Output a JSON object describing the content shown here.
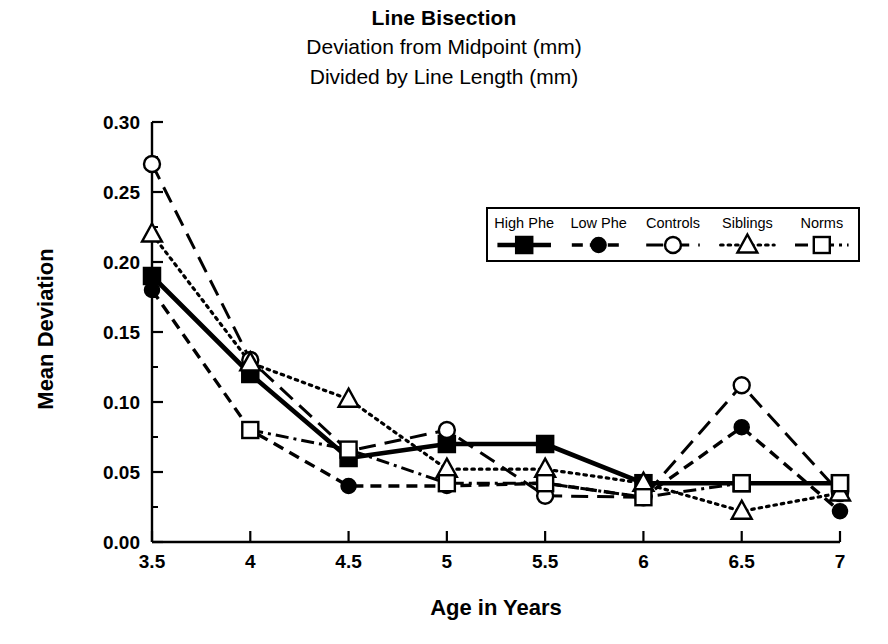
{
  "chart_data": {
    "type": "line",
    "title": "Line Bisection",
    "subtitle_1": "Deviation from Midpoint (mm)",
    "subtitle_2": "Divided by Line Length (mm)",
    "xlabel": "Age in Years",
    "ylabel": "Mean Deviation",
    "x": [
      3.5,
      4,
      4.5,
      5,
      5.5,
      6,
      6.5,
      7
    ],
    "xtick_labels": [
      "3.5",
      "4",
      "4.5",
      "5",
      "5.5",
      "6",
      "6.5",
      "7"
    ],
    "ytick_labels": [
      "0.00",
      "0.05",
      "0.10",
      "0.15",
      "0.20",
      "0.25",
      "0.30"
    ],
    "ytick_values": [
      0.0,
      0.05,
      0.1,
      0.15,
      0.2,
      0.25,
      0.3
    ],
    "yminor_values": [
      0.025,
      0.075,
      0.125,
      0.175,
      0.225,
      0.275
    ],
    "xlim": [
      3.5,
      7
    ],
    "ylim": [
      0.0,
      0.3
    ],
    "grid": false,
    "legend_position": "upper right inside",
    "series": [
      {
        "name": "High Phe",
        "marker": "filled-square",
        "line": "solid",
        "x": [
          3.5,
          4,
          4.5,
          5,
          5.5,
          6,
          6.5,
          7
        ],
        "values": [
          0.19,
          0.12,
          0.06,
          0.07,
          0.07,
          0.042,
          0.042,
          0.042
        ]
      },
      {
        "name": "Low Phe",
        "marker": "filled-circle",
        "line": "dashed",
        "x": [
          3.5,
          4,
          4.5,
          5,
          5.5,
          6,
          6.5,
          7
        ],
        "values": [
          0.18,
          0.08,
          0.04,
          0.04,
          0.042,
          0.032,
          0.082,
          0.022
        ]
      },
      {
        "name": "Controls",
        "marker": "open-circle",
        "line": "long-dash",
        "x": [
          3.5,
          4,
          4.5,
          5,
          5.5,
          6,
          6.5,
          7
        ],
        "values": [
          0.27,
          0.13,
          0.065,
          0.08,
          0.033,
          0.032,
          0.112,
          0.035
        ]
      },
      {
        "name": "Siblings",
        "marker": "open-triangle",
        "line": "dotted",
        "x": [
          3.5,
          4,
          4.5,
          5,
          5.5,
          6,
          6.5,
          7
        ],
        "values": [
          0.22,
          0.128,
          0.102,
          0.052,
          0.052,
          0.042,
          0.022,
          0.035
        ]
      },
      {
        "name": "Norms",
        "marker": "open-square",
        "line": "dash-dot",
        "x": [
          4,
          4.5,
          5,
          5.5,
          6,
          6.5,
          7
        ],
        "values": [
          0.08,
          0.066,
          0.042,
          0.042,
          0.032,
          0.042,
          0.042
        ]
      }
    ]
  },
  "colors": {
    "ink": "#000000",
    "background": "#ffffff"
  }
}
